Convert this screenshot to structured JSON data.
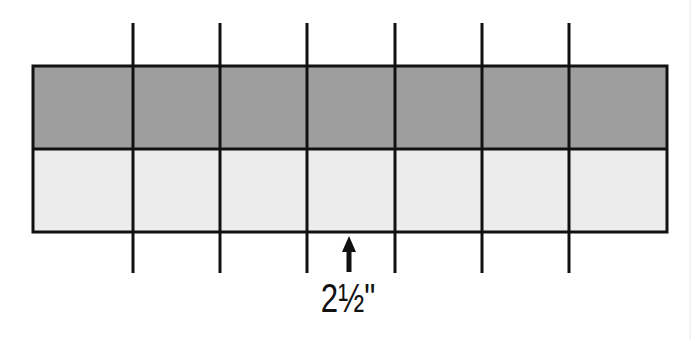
{
  "diagram": {
    "bands": [
      {
        "name": "top-band",
        "color": "#9e9e9e",
        "y": 66,
        "height": 83
      },
      {
        "name": "bottom-band",
        "color": "#ececec",
        "y": 149,
        "height": 83
      }
    ],
    "rect": {
      "x": 33,
      "y": 66,
      "width": 634,
      "height": 166,
      "stroke": "#111111",
      "stroke_width": 3
    },
    "cut_lines": {
      "xs": [
        133,
        220,
        307,
        395,
        482,
        569
      ],
      "y_top": 23,
      "y_bottom": 273,
      "stroke": "#111111",
      "stroke_width": 3
    },
    "arrow": {
      "x": 349,
      "y_tip": 236,
      "y_tail": 272,
      "color": "#111111"
    },
    "measurement_label": "2½\""
  }
}
